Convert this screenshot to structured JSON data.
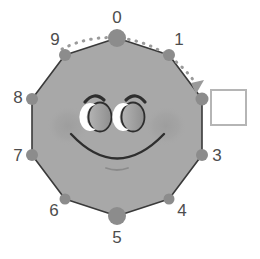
{
  "figure": {
    "background_color": "#ffffff"
  },
  "colors": {
    "face_fill": "#a8a8a8",
    "face_stroke": "#3a3a3a",
    "node_fill": "#8c8c8c",
    "node_active_fill": "#8c8c8c",
    "label_color": "#4d4d4d",
    "arc_color": "#9a9a9a",
    "feature_stroke": "#2e2e2e",
    "eye_fill": "#9a9a9a",
    "eye_highlight": "#ffffff",
    "blush_fill": "#9a9a9a",
    "box_fill": "#ffffff",
    "box_border": "#b5b5b5"
  },
  "polygon": {
    "shape": "decagon",
    "sides": 10,
    "center": {
      "x": 117,
      "y": 127
    },
    "radius": 89,
    "rotation_deg": -90
  },
  "nodes": [
    {
      "id": "node-0",
      "label": "0",
      "angle_deg": -90,
      "size": "large",
      "cx": 117,
      "cy": 38,
      "r": 9,
      "label_x": 117,
      "label_y": 18
    },
    {
      "id": "node-1",
      "label": "1",
      "angle_deg": -54,
      "size": "small",
      "cx": 169,
      "cy": 55,
      "r": 6,
      "label_x": 178,
      "label_y": 40
    },
    {
      "id": "node-2",
      "label": "",
      "angle_deg": -18,
      "size": "small",
      "cx": 202,
      "cy": 99,
      "r": 6,
      "label_x": 0,
      "label_y": 0
    },
    {
      "id": "node-3",
      "label": "3",
      "angle_deg": 18,
      "size": "small",
      "cx": 202,
      "cy": 155,
      "r": 6,
      "label_x": 216,
      "label_y": 157
    },
    {
      "id": "node-4",
      "label": "4",
      "angle_deg": 54,
      "size": "small",
      "cx": 169,
      "cy": 199,
      "r": 6,
      "label_x": 181,
      "label_y": 212
    },
    {
      "id": "node-5",
      "label": "5",
      "angle_deg": 90,
      "size": "large",
      "cx": 117,
      "cy": 216,
      "r": 9,
      "label_x": 117,
      "label_y": 239
    },
    {
      "id": "node-6",
      "label": "6",
      "angle_deg": 126,
      "size": "small",
      "cx": 65,
      "cy": 199,
      "r": 6,
      "label_x": 55,
      "label_y": 212
    },
    {
      "id": "node-7",
      "label": "7",
      "angle_deg": 162,
      "size": "small",
      "cx": 32,
      "cy": 155,
      "r": 6,
      "label_x": 19,
      "label_y": 157
    },
    {
      "id": "node-8",
      "label": "8",
      "angle_deg": 198,
      "size": "small",
      "cx": 32,
      "cy": 99,
      "r": 6,
      "label_x": 19,
      "label_y": 99
    },
    {
      "id": "node-9",
      "label": "9",
      "angle_deg": 234,
      "size": "small",
      "cx": 65,
      "cy": 55,
      "r": 6,
      "label_x": 56,
      "label_y": 40
    }
  ],
  "arrow_arc": {
    "name": "rotation-arc",
    "from_node": "node-9",
    "to_node": "node-2",
    "direction": "clockwise",
    "style": "dotted",
    "has_arrowhead": true,
    "arrowhead_x": 198,
    "arrowhead_y": 88
  },
  "face": {
    "left_eye": {
      "cx": 100,
      "cy": 116,
      "rx": 11,
      "ry": 14
    },
    "right_eye": {
      "cx": 133,
      "cy": 116,
      "rx": 11,
      "ry": 14
    },
    "left_brow_path": "M 84 101 Q 93 91 104 99",
    "right_brow_path": "M 125 99 Q 136 91 145 101",
    "smile_path": "M 71 133 Q 117 181 163 133",
    "mouth_detail_path": "M 106 168 Q 117 173 128 168",
    "left_blush": {
      "cx": 68,
      "cy": 126,
      "rx": 20,
      "ry": 19
    },
    "right_blush": {
      "cx": 166,
      "cy": 126,
      "rx": 20,
      "ry": 19
    }
  },
  "callout_box": {
    "name": "state-box",
    "text": "",
    "x": 211,
    "y": 90,
    "width": 35,
    "height": 35
  }
}
